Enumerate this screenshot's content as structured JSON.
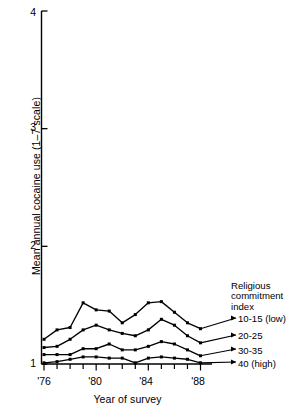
{
  "chart_data": {
    "type": "line",
    "title": "",
    "xlabel": "Year of survey",
    "ylabel": "Mean annual cocaine use (1–7 scale)",
    "ylim": [
      1,
      4
    ],
    "xlim": [
      1976,
      1988
    ],
    "yticks": [
      "1",
      "2",
      "3",
      "4"
    ],
    "ytick_values": [
      1,
      2,
      3,
      4
    ],
    "xticks": [
      "'76",
      "'80",
      "'84",
      "'88"
    ],
    "xtick_values": [
      1976,
      1980,
      1984,
      1988
    ],
    "grid": false,
    "legend_position": "right",
    "legend_title": "Religious commitment index",
    "x": [
      1976,
      1977,
      1978,
      1979,
      1980,
      1981,
      1982,
      1983,
      1984,
      1985,
      1986,
      1987,
      1988
    ],
    "series": [
      {
        "name": "10-15 (low)",
        "values": [
          1.21,
          1.29,
          1.31,
          1.52,
          1.46,
          1.45,
          1.35,
          1.42,
          1.52,
          1.53,
          1.44,
          1.35,
          1.3
        ]
      },
      {
        "name": "20-25",
        "values": [
          1.14,
          1.15,
          1.21,
          1.29,
          1.33,
          1.29,
          1.26,
          1.24,
          1.29,
          1.38,
          1.33,
          1.24,
          1.18
        ]
      },
      {
        "name": "30-35",
        "values": [
          1.08,
          1.08,
          1.08,
          1.13,
          1.13,
          1.17,
          1.12,
          1.12,
          1.15,
          1.19,
          1.17,
          1.12,
          1.07
        ]
      },
      {
        "name": "40 (high)",
        "values": [
          1.01,
          1.02,
          1.04,
          1.06,
          1.06,
          1.05,
          1.05,
          1.01,
          1.05,
          1.06,
          1.05,
          1.04,
          1.01
        ]
      }
    ]
  },
  "legend": {
    "title_line1": "Religious",
    "title_line2": "commitment",
    "title_line3": "index",
    "entries": [
      {
        "label": "10-15 (low)"
      },
      {
        "label": "20-25"
      },
      {
        "label": "30-35"
      },
      {
        "label": "40 (high)"
      }
    ]
  },
  "axes": {
    "ylabel": "Mean annual cocaine use (1–7 scale)",
    "xlabel": "Year of survey",
    "ytick_1": "1",
    "ytick_2": "2",
    "ytick_3": "3",
    "ytick_4": "4",
    "xtick_76": "'76",
    "xtick_80": "'80",
    "xtick_84": "'84",
    "xtick_88": "'88"
  },
  "colors": {
    "line": "#000000",
    "axis": "#000000",
    "background": "#ffffff"
  }
}
